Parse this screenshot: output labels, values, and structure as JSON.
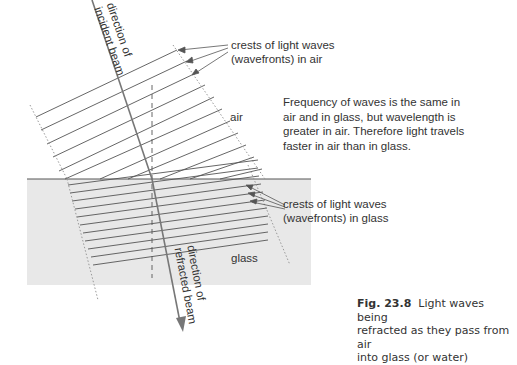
{
  "figure": {
    "number": "Fig. 23.8",
    "caption": "Light waves being refracted as they pass from air into glass (or water)",
    "caption_lines": [
      "refracted as they pass from air",
      "into glass (or water)"
    ],
    "caption_first_line_rest": "Light waves being"
  },
  "labels": {
    "incident_beam": [
      "direction of",
      "incident beam"
    ],
    "refracted_beam": [
      "direction of",
      "refracted beam"
    ],
    "crests_air": [
      "crests of light waves",
      "(wavefronts) in air"
    ],
    "crests_glass": [
      "crests of light waves",
      "(wavefronts) in glass"
    ],
    "medium_air": "air",
    "medium_glass": "glass",
    "explanation": [
      "Frequency of waves is the same in",
      "air and in glass, but wavelength is",
      "greater in air. Therefore light travels",
      "faster in air than in glass."
    ]
  },
  "colors": {
    "glass_fill": "#e8e8e8",
    "line": "#555555",
    "beam": "#666666",
    "text": "#333333"
  }
}
